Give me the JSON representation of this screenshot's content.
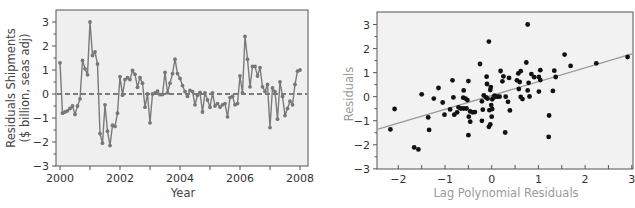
{
  "chart_data": [
    {
      "type": "line",
      "title": "",
      "xlabel": "Year",
      "ylabel": [
        "Residuals Shipments",
        "($ billion, seas adj)"
      ],
      "xlim": [
        1999.95,
        2008.15
      ],
      "ylim": [
        -3,
        3.5
      ],
      "x_ticks": [
        2000,
        2002,
        2004,
        2006,
        2008
      ],
      "x_tick_labels": [
        "2000",
        "2002",
        "2004",
        "2006",
        "2008"
      ],
      "x_minor_ticks": [
        2001,
        2003,
        2005,
        2007
      ],
      "y_ticks": [
        -3,
        -2,
        -1,
        0,
        1,
        2,
        3
      ],
      "y_tick_labels": [
        "−3",
        "−2",
        "−1",
        "0",
        "1",
        "2",
        "3"
      ],
      "reference_line": {
        "y": 0,
        "style": "dashed"
      },
      "grid": false,
      "colors": {
        "line": "#777777",
        "marker": "#777777",
        "reference": "#555555",
        "background": "#efefef",
        "frame": "#555555"
      },
      "series": [
        {
          "name": "Residuals Shipments",
          "start": 2000.0,
          "step_years": 0.08333,
          "values": [
            1.3,
            -0.8,
            -0.75,
            -0.7,
            -0.6,
            -0.5,
            -0.85,
            -0.5,
            -0.2,
            1.4,
            1.05,
            0.8,
            3.0,
            1.6,
            1.75,
            1.25,
            -1.65,
            -2.05,
            -0.45,
            -1.55,
            -2.15,
            -1.3,
            -1.35,
            -0.8,
            0.72,
            -0.05,
            0.6,
            0.68,
            0.6,
            0.98,
            0.82,
            0.28,
            0.68,
            0.45,
            -0.55,
            0.0,
            -1.2,
            0.0,
            0.05,
            0.12,
            -0.03,
            -0.02,
            0.9,
            0.05,
            0.45,
            0.85,
            1.45,
            0.85,
            0.65,
            0.35,
            0.1,
            -0.1,
            0.15,
            0.1,
            -0.45,
            -0.05,
            0.07,
            -0.75,
            0.05,
            -0.25,
            -0.55,
            0.05,
            -0.5,
            -0.4,
            -0.55,
            -0.45,
            -0.4,
            -0.95,
            -0.15,
            -0.1,
            -0.45,
            -0.4,
            0.75,
            0.05,
            2.4,
            1.45,
            0.3,
            1.15,
            1.15,
            0.75,
            1.1,
            0.3,
            0.1,
            0.4,
            -1.4,
            0.25,
            0.1,
            -1.05,
            0.5,
            -0.1,
            -0.9,
            -0.6,
            -0.3,
            -0.45,
            0.4,
            0.95,
            1.0
          ]
        }
      ]
    },
    {
      "type": "scatter",
      "title": "",
      "xlabel": "Lag Polynomial Residuals",
      "ylabel": "Residuals",
      "xlim": [
        -2.4,
        3.0
      ],
      "ylim": [
        -3,
        3.5
      ],
      "x_ticks": [
        -2,
        -1,
        0,
        1,
        2,
        3
      ],
      "x_tick_labels": [
        "−2",
        "−1",
        "0",
        "1",
        "2",
        "3"
      ],
      "x_minor_ticks": [
        -1.5,
        -0.5,
        0.5,
        1.5,
        2.5
      ],
      "y_ticks": [
        -3,
        -2,
        -1,
        0,
        1,
        2,
        3
      ],
      "y_tick_labels": [
        "−3",
        "−2",
        "−1",
        "0",
        "1",
        "2",
        "3"
      ],
      "grid": false,
      "colors": {
        "points": "#111111",
        "fit_line": "#999999",
        "background": "#f2f2f2",
        "frame": "#555555"
      },
      "fit_line": {
        "intercept": 0.04,
        "slope": 0.58
      },
      "points": [
        [
          -2.17,
          -1.36
        ],
        [
          -2.08,
          -0.51
        ],
        [
          -1.66,
          -2.11
        ],
        [
          -1.57,
          -2.19
        ],
        [
          -1.5,
          0.1
        ],
        [
          -1.36,
          -0.86
        ],
        [
          -1.34,
          -1.38
        ],
        [
          -1.24,
          -0.08
        ],
        [
          -1.14,
          0.36
        ],
        [
          -1.05,
          -0.24
        ],
        [
          -1.01,
          -0.75
        ],
        [
          -0.89,
          -0.53
        ],
        [
          -0.84,
          0.68
        ],
        [
          -0.82,
          -0.03
        ],
        [
          -0.8,
          -0.75
        ],
        [
          -0.74,
          -0.65
        ],
        [
          -0.71,
          -0.44
        ],
        [
          -0.66,
          -0.49
        ],
        [
          -0.61,
          -0.04
        ],
        [
          -0.6,
          0.26
        ],
        [
          -0.6,
          -0.49
        ],
        [
          -0.56,
          -0.08
        ],
        [
          -0.54,
          -0.49
        ],
        [
          -0.52,
          -0.14
        ],
        [
          -0.5,
          0.65
        ],
        [
          -0.5,
          -1.6
        ],
        [
          -0.49,
          -0.83
        ],
        [
          -0.46,
          -0.61
        ],
        [
          -0.46,
          -1.04
        ],
        [
          -0.41,
          -0.65
        ],
        [
          -0.36,
          -0.64
        ],
        [
          -0.25,
          1.36
        ],
        [
          -0.21,
          -0.19
        ],
        [
          -0.21,
          -1.0
        ],
        [
          -0.19,
          -0.54
        ],
        [
          -0.17,
          0.06
        ],
        [
          -0.12,
          -0.03
        ],
        [
          -0.11,
          0.83
        ],
        [
          -0.1,
          0.53
        ],
        [
          -0.09,
          -0.08
        ],
        [
          -0.06,
          2.29
        ],
        [
          -0.06,
          -1.25
        ],
        [
          -0.05,
          -0.56
        ],
        [
          -0.03,
          -1.15
        ],
        [
          -0.03,
          0.28
        ],
        [
          -0.02,
          0.4
        ],
        [
          -0.01,
          -0.35
        ],
        [
          0.0,
          -0.83
        ],
        [
          0.01,
          -0.11
        ],
        [
          0.01,
          -0.51
        ],
        [
          0.04,
          -0.03
        ],
        [
          0.06,
          0.04
        ],
        [
          0.09,
          0.0
        ],
        [
          0.13,
          0.0
        ],
        [
          0.17,
          0.0
        ],
        [
          0.19,
          1.07
        ],
        [
          0.23,
          0.64
        ],
        [
          0.25,
          0.85
        ],
        [
          0.29,
          -1.49
        ],
        [
          0.3,
          0.0
        ],
        [
          0.35,
          -0.21
        ],
        [
          0.37,
          0.78
        ],
        [
          0.39,
          -0.57
        ],
        [
          0.54,
          0.68
        ],
        [
          0.57,
          0.97
        ],
        [
          0.58,
          0.32
        ],
        [
          0.6,
          0.61
        ],
        [
          0.62,
          1.06
        ],
        [
          0.62,
          -0.01
        ],
        [
          0.66,
          -0.1
        ],
        [
          0.74,
          1.42
        ],
        [
          0.77,
          3.0
        ],
        [
          0.77,
          0.26
        ],
        [
          0.79,
          0.58
        ],
        [
          0.81,
          0.01
        ],
        [
          0.85,
          0.94
        ],
        [
          0.91,
          0.81
        ],
        [
          1.01,
          0.82
        ],
        [
          1.01,
          0.21
        ],
        [
          1.04,
          1.1
        ],
        [
          1.04,
          0.69
        ],
        [
          1.23,
          -0.78
        ],
        [
          1.22,
          -1.67
        ],
        [
          1.31,
          0.24
        ],
        [
          1.34,
          1.08
        ],
        [
          1.37,
          0.82
        ],
        [
          1.56,
          1.75
        ],
        [
          1.69,
          1.28
        ],
        [
          2.24,
          1.39
        ],
        [
          2.91,
          1.65
        ]
      ]
    }
  ]
}
